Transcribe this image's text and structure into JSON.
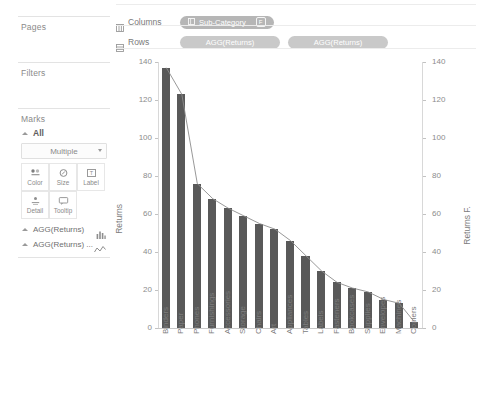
{
  "left_panel": {
    "pages_card": {
      "title": "Pages"
    },
    "filters_card": {
      "title": "Filters"
    },
    "marks_card": {
      "title": "Marks",
      "all_label": "All",
      "mark_type": "Multiple",
      "buttons": [
        {
          "label": "Color",
          "icon": "color-icon"
        },
        {
          "label": "Size",
          "icon": "size-icon"
        },
        {
          "label": "Label",
          "icon": "label-icon"
        },
        {
          "label": "Detail",
          "icon": "detail-icon"
        },
        {
          "label": "Tooltip",
          "icon": "tooltip-icon"
        }
      ]
    },
    "mark_layers": [
      {
        "label": "AGG(Returns)",
        "icon": "bar-chart-icon"
      },
      {
        "label": "AGG(Returns) ...",
        "icon": "line-chart-icon"
      }
    ]
  },
  "shelves": {
    "columns": {
      "label": "Columns",
      "pills": [
        {
          "text": "Sub-Category",
          "icon": "discrete-field-icon",
          "badge": "F"
        }
      ]
    },
    "rows": {
      "label": "Rows",
      "pills": [
        {
          "text": "AGG(Returns)"
        },
        {
          "text": "AGG(Returns)"
        }
      ]
    }
  },
  "colors": {
    "bar": "#595959",
    "line": "#8c8c8c",
    "pill": "#b6b6b6",
    "axis": "#8c8c8c"
  },
  "chart_data": {
    "type": "bar",
    "title": "",
    "xlabel": "",
    "ylabel": "Returns",
    "y2label": "Returns F.",
    "ylim": [
      0,
      140
    ],
    "y2lim": [
      0,
      140
    ],
    "yticks": [
      0,
      20,
      40,
      60,
      80,
      100,
      120,
      140
    ],
    "y2ticks": [
      0,
      20,
      40,
      60,
      80,
      100,
      120,
      140
    ],
    "grid": false,
    "legend": "none",
    "categories": [
      "Binders",
      "Paper",
      "Phones",
      "Furnishings",
      "Accessories",
      "Storage",
      "Chairs",
      "Art",
      "Appliances",
      "Tables",
      "Labels",
      "Fasteners",
      "Bookcases",
      "Supplies",
      "Envelopes",
      "Machines",
      "Copiers"
    ],
    "series": [
      {
        "name": "AGG(Returns)",
        "type": "bar",
        "values": [
          137,
          123,
          76,
          68,
          63,
          59,
          55,
          52,
          46,
          38,
          30,
          24,
          21,
          19,
          15,
          13,
          3
        ]
      },
      {
        "name": "AGG(Returns) F.",
        "type": "line",
        "values": [
          137,
          123,
          76,
          68,
          63,
          59,
          55,
          52,
          46,
          38,
          30,
          24,
          21,
          19,
          15,
          13,
          3
        ]
      }
    ]
  }
}
